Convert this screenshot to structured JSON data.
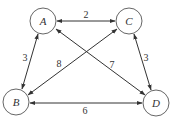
{
  "diagram": {
    "type": "weighted-undirected-graph",
    "style": {
      "node_stroke": "#555555",
      "edge_stroke": "#333333",
      "background": "#ffffff"
    },
    "nodes": [
      {
        "id": "A",
        "label": "A",
        "cx": 43,
        "cy": 21,
        "r": 13
      },
      {
        "id": "C",
        "label": "C",
        "cx": 129,
        "cy": 21,
        "r": 13
      },
      {
        "id": "B",
        "label": "B",
        "cx": 16,
        "cy": 102,
        "r": 13
      },
      {
        "id": "D",
        "label": "D",
        "cx": 156,
        "cy": 103,
        "r": 13
      }
    ],
    "edges": [
      {
        "from": "A",
        "to": "C",
        "weight": "2",
        "x1": 57,
        "y1": 21,
        "x2": 115,
        "y2": 21,
        "lx": 86,
        "ly": 14
      },
      {
        "from": "A",
        "to": "B",
        "weight": "3",
        "x1": 38,
        "y1": 34,
        "x2": 22,
        "y2": 89,
        "lx": 25,
        "ly": 57
      },
      {
        "from": "C",
        "to": "B",
        "weight": "8",
        "x1": 117,
        "y1": 29,
        "x2": 28,
        "y2": 95,
        "lx": 59,
        "ly": 63
      },
      {
        "from": "A",
        "to": "D",
        "weight": "7",
        "x1": 56,
        "y1": 29,
        "x2": 145,
        "y2": 95,
        "lx": 112,
        "ly": 64
      },
      {
        "from": "C",
        "to": "D",
        "weight": "3",
        "x1": 134,
        "y1": 34,
        "x2": 151,
        "y2": 90,
        "lx": 146,
        "ly": 57
      },
      {
        "from": "B",
        "to": "D",
        "weight": "6",
        "x1": 30,
        "y1": 103,
        "x2": 142,
        "y2": 103,
        "lx": 85,
        "ly": 110
      }
    ]
  }
}
